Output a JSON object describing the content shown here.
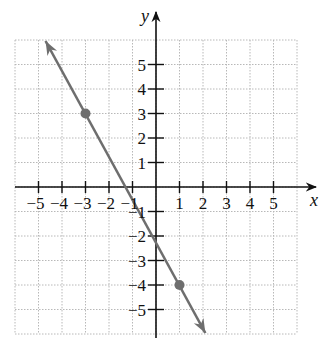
{
  "chart_data": {
    "type": "line",
    "title": "",
    "xlabel": "x",
    "ylabel": "y",
    "xlim": [
      -6,
      6
    ],
    "ylim": [
      -6,
      6
    ],
    "grid": true,
    "x_ticks": [
      -5,
      -4,
      -3,
      -2,
      -1,
      1,
      2,
      3,
      4,
      5
    ],
    "y_ticks": [
      -5,
      -4,
      -3,
      -2,
      -1,
      1,
      2,
      3,
      4,
      5
    ],
    "x_tick_labels": [
      "−5",
      "−4",
      "−3",
      "−2",
      "−1",
      "1",
      "2",
      "3",
      "4",
      "5"
    ],
    "y_tick_labels": [
      "−5",
      "−4",
      "−3",
      "−2",
      "−1",
      "1",
      "2",
      "3",
      "4",
      "5"
    ],
    "series": [
      {
        "name": "line through (-3, 3) and (1, -4)",
        "kind": "line",
        "slope": -1.75,
        "intercept": -2.25,
        "arrows_both_ends": true,
        "endpoints": [
          [
            -4.7,
            6.0
          ],
          [
            2.1,
            -6.0
          ]
        ],
        "color": "#6e6e6e"
      },
      {
        "name": "plotted points",
        "kind": "scatter",
        "points": [
          [
            -3,
            3
          ],
          [
            1,
            -4
          ]
        ],
        "color": "#6e6e6e"
      }
    ]
  },
  "colors": {
    "axis": "#111111",
    "grid": "#b8b8b8",
    "line": "#6e6e6e",
    "point": "#6e6e6e"
  }
}
